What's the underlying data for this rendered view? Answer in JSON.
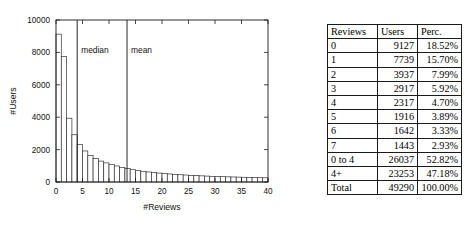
{
  "chart_data": {
    "type": "bar",
    "title": "",
    "xlabel": "#Reviews",
    "ylabel": "#Users",
    "xlim": [
      0,
      40
    ],
    "ylim": [
      0,
      10000
    ],
    "xticks": [
      0,
      5,
      10,
      15,
      20,
      25,
      30,
      35,
      40
    ],
    "yticks": [
      0,
      2000,
      4000,
      6000,
      8000,
      10000
    ],
    "grid": false,
    "legend": "none",
    "categories": [
      0,
      1,
      2,
      3,
      4,
      5,
      6,
      7,
      8,
      9,
      10,
      11,
      12,
      13,
      14,
      15,
      16,
      17,
      18,
      19,
      20,
      21,
      22,
      23,
      24,
      25,
      26,
      27,
      28,
      29,
      30,
      31,
      32,
      33,
      34,
      35,
      36,
      37,
      38,
      39
    ],
    "values": [
      9127,
      7739,
      3937,
      2917,
      2317,
      1916,
      1642,
      1443,
      1290,
      1180,
      1080,
      990,
      905,
      830,
      760,
      700,
      660,
      620,
      585,
      550,
      520,
      495,
      470,
      450,
      430,
      410,
      395,
      380,
      365,
      350,
      340,
      330,
      320,
      310,
      300,
      292,
      284,
      276,
      268,
      260
    ],
    "annotations": [
      {
        "name": "median",
        "label": "median",
        "x": 4.0,
        "type": "vline"
      },
      {
        "name": "mean",
        "label": "mean",
        "x": 13.4,
        "type": "vline"
      }
    ]
  },
  "table": {
    "headers": [
      "Reviews",
      "Users",
      "Perc."
    ],
    "rows": [
      {
        "reviews": "0",
        "users": "9127",
        "perc": "18.52%"
      },
      {
        "reviews": "1",
        "users": "7739",
        "perc": "15.70%"
      },
      {
        "reviews": "2",
        "users": "3937",
        "perc": "7.99%"
      },
      {
        "reviews": "3",
        "users": "2917",
        "perc": "5.92%"
      },
      {
        "reviews": "4",
        "users": "2317",
        "perc": "4.70%"
      },
      {
        "reviews": "5",
        "users": "1916",
        "perc": "3.89%"
      },
      {
        "reviews": "6",
        "users": "1642",
        "perc": "3.33%"
      },
      {
        "reviews": "7",
        "users": "1443",
        "perc": "2.93%"
      }
    ],
    "summary_rows": [
      {
        "reviews": "0 to 4",
        "users": "26037",
        "perc": "52.82%"
      },
      {
        "reviews": "4+",
        "users": "23253",
        "perc": "47.18%"
      }
    ],
    "total_row": {
      "reviews": "Total",
      "users": "49290",
      "perc": "100.00%"
    }
  }
}
